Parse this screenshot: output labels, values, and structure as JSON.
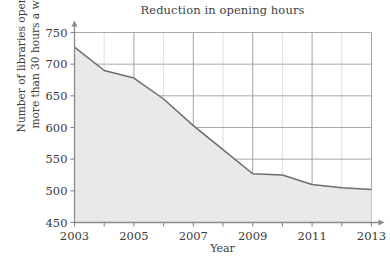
{
  "chart_data": {
    "type": "area",
    "title": "Reduction in opening hours",
    "xlabel": "Year",
    "ylabel_line1": "Number of libraries open for",
    "ylabel_line2": "more than 30 hours a week",
    "ylabel": "Number of libraries open for more than 30 hours a week",
    "x": [
      2003,
      2004,
      2005,
      2006,
      2007,
      2008,
      2009,
      2010,
      2011,
      2012,
      2013
    ],
    "values": [
      727,
      690,
      678,
      645,
      603,
      565,
      527,
      525,
      510,
      505,
      502
    ],
    "xlim": [
      2003,
      2013
    ],
    "ylim": [
      450,
      750
    ],
    "y_ticks": [
      450,
      500,
      550,
      600,
      650,
      700,
      750
    ],
    "y_tick_labels": [
      "450",
      "500",
      "550",
      "600",
      "650",
      "700",
      "750"
    ],
    "x_ticks": [
      2003,
      2004,
      2005,
      2006,
      2007,
      2008,
      2009,
      2010,
      2011,
      2012,
      2013
    ],
    "x_tick_labels_shown": [
      "2003",
      "2005",
      "2007",
      "2009",
      "2011",
      "2013"
    ],
    "x_labeled_ticks": [
      2003,
      2005,
      2007,
      2009,
      2011,
      2013
    ],
    "grid": true,
    "legend": "none",
    "series_name": "Libraries open more than 30 hours a week",
    "colors": {
      "line": "#6d6d6d",
      "fill": "#e9e9e9",
      "grid_major": "#9a9a9a",
      "grid_minor": "#d6d6d6",
      "axis": "#8a8a8a",
      "text": "#3a3a3a",
      "background": "#ffffff"
    }
  }
}
